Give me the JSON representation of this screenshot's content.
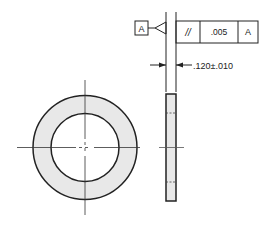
{
  "drawing": {
    "datum_label": "A",
    "fcf": {
      "symbol": "//",
      "symbol_name": "parallelism",
      "tolerance": ".005",
      "datum": "A"
    },
    "dimension": ".120±.010",
    "colors": {
      "line": "#222222",
      "fill": "#e8e8e8",
      "background": "#ffffff"
    }
  }
}
